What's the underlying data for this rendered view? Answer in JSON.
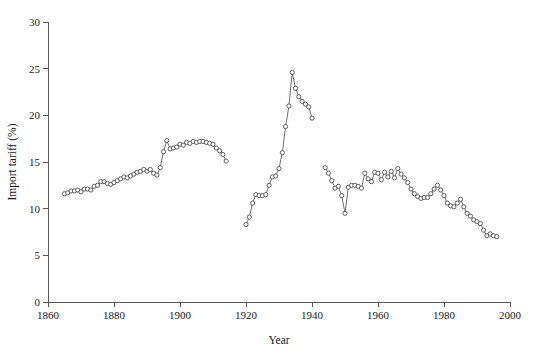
{
  "chart_data": {
    "type": "line",
    "title": "",
    "xlabel": "Year",
    "ylabel": "Import tariff (%)",
    "xlim": [
      1860,
      2000
    ],
    "ylim": [
      0,
      30
    ],
    "xticks": [
      1860,
      1880,
      1900,
      1920,
      1940,
      1960,
      1980,
      2000
    ],
    "yticks": [
      0,
      5,
      10,
      15,
      20,
      25,
      30
    ],
    "grid": false,
    "legend": "none",
    "markers": "open-circle",
    "series": [
      {
        "name": "Pre-WWI period",
        "x": [
          1865,
          1866,
          1867,
          1868,
          1869,
          1870,
          1871,
          1872,
          1873,
          1874,
          1875,
          1876,
          1877,
          1878,
          1879,
          1880,
          1881,
          1882,
          1883,
          1884,
          1885,
          1886,
          1887,
          1888,
          1889,
          1890,
          1891,
          1892,
          1893,
          1894,
          1895,
          1896,
          1897,
          1898,
          1899,
          1900,
          1901,
          1902,
          1903,
          1904,
          1905,
          1906,
          1907,
          1908,
          1909,
          1910,
          1911,
          1912,
          1913,
          1914
        ],
        "y": [
          11.6,
          11.7,
          11.9,
          11.9,
          12.0,
          11.8,
          12.1,
          12.1,
          12.0,
          12.4,
          12.5,
          12.9,
          12.9,
          12.7,
          12.6,
          12.8,
          13.0,
          13.2,
          13.4,
          13.3,
          13.5,
          13.7,
          13.9,
          14.0,
          14.2,
          14.0,
          14.2,
          13.8,
          13.6,
          14.4,
          16.1,
          17.3,
          16.4,
          16.5,
          16.6,
          16.9,
          16.8,
          17.1,
          17.0,
          17.2,
          17.1,
          17.2,
          17.2,
          17.1,
          17.0,
          16.9,
          16.5,
          16.2,
          15.8,
          15.1
        ]
      },
      {
        "name": "Interwar period",
        "x": [
          1920,
          1921,
          1922,
          1923,
          1924,
          1925,
          1926,
          1927,
          1928,
          1929,
          1930,
          1931,
          1932,
          1933,
          1934,
          1935,
          1936,
          1937,
          1938,
          1939,
          1940
        ],
        "y": [
          8.3,
          9.1,
          10.6,
          11.5,
          11.4,
          11.4,
          11.5,
          12.5,
          13.4,
          13.5,
          14.3,
          16.0,
          18.8,
          21.0,
          24.6,
          22.9,
          22.0,
          21.5,
          21.2,
          20.9,
          19.7
        ]
      },
      {
        "name": "Post-WWII period",
        "x": [
          1944,
          1945,
          1946,
          1947,
          1948,
          1949,
          1950,
          1951,
          1952,
          1953,
          1954,
          1955,
          1956,
          1957,
          1958,
          1959,
          1960,
          1961,
          1962,
          1963,
          1964,
          1965,
          1966,
          1967,
          1968,
          1969,
          1970,
          1971,
          1972,
          1973,
          1974,
          1975,
          1976,
          1977,
          1978,
          1979,
          1980,
          1981,
          1982,
          1983,
          1984,
          1985,
          1986,
          1987,
          1988,
          1989,
          1990,
          1991,
          1992,
          1993,
          1994,
          1995,
          1996
        ],
        "y": [
          14.4,
          13.8,
          13.0,
          12.2,
          12.4,
          11.4,
          9.5,
          12.3,
          12.5,
          12.5,
          12.4,
          12.2,
          13.8,
          13.2,
          12.9,
          13.9,
          13.8,
          13.1,
          13.9,
          13.4,
          14.0,
          13.3,
          14.3,
          13.7,
          13.3,
          12.8,
          12.1,
          11.6,
          11.3,
          11.1,
          11.2,
          11.2,
          11.6,
          12.1,
          12.5,
          12.0,
          11.4,
          10.6,
          10.3,
          10.2,
          10.6,
          11.0,
          10.2,
          9.5,
          9.2,
          8.8,
          8.6,
          8.4,
          7.7,
          7.1,
          7.3,
          7.1,
          7.0
        ]
      }
    ]
  }
}
